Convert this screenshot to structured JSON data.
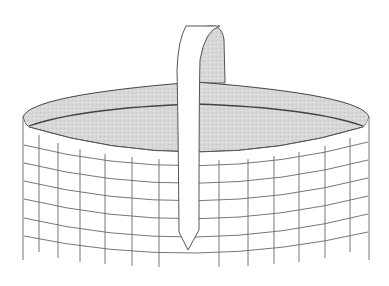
{
  "figure": {
    "title": "Woven basket line drawing",
    "subject": "basket",
    "colors": {
      "background": "#ffffff",
      "line": "#555555",
      "interior_shade": "#d9d9d9",
      "handle_fill": "#ffffff"
    },
    "basket": {
      "rim": {
        "cx": 196,
        "top_y": 82,
        "side_y": 117,
        "left_x": 23,
        "right_x": 369,
        "front_y": 152
      },
      "bands_count": 6,
      "uprights_count": 14,
      "handle": {
        "front_strap": "white",
        "back_strap": "shaded",
        "tip": "pointed"
      }
    }
  }
}
